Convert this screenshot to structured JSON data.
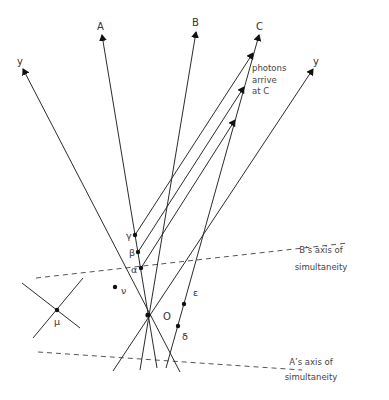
{
  "diagram": {
    "worldline_labels": {
      "y_left": "y",
      "a": "A",
      "b": "B",
      "c": "C",
      "y_right": "y"
    },
    "annotation_photons": [
      "photons",
      "arrive",
      "at C"
    ],
    "axes_labels": {
      "b_axis": [
        "B’s axis of",
        "simultaneity"
      ],
      "a_axis": [
        "A’s axis of",
        "simultaneity"
      ]
    },
    "event_labels": {
      "origin": "O",
      "alpha": "α",
      "beta": "β",
      "gamma": "γ",
      "delta": "δ",
      "epsilon": "ε",
      "mu": "μ",
      "nu": "ν"
    },
    "colors": {
      "line": "#2b2b2b",
      "dashed": "#555555",
      "text": "#333333"
    }
  }
}
